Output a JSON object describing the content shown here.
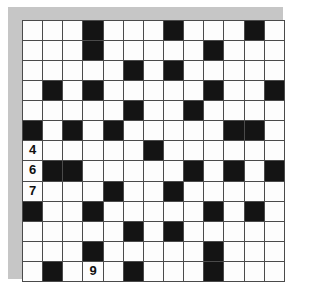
{
  "puzzle": {
    "type": "crossword-grid",
    "rows": 13,
    "columns": 13,
    "cell_size_px": 20,
    "colors": {
      "frame": "#c6c6c6",
      "grid_line": "#4a4a4a",
      "open_cell": "#fdfdfd",
      "block_cell": "#141414",
      "number_text": "#101010",
      "page_background": "#ffffff"
    },
    "legend": {
      "open_label": "open square",
      "block_label": "blocked square"
    },
    "clue_numbers": [
      {
        "number": "4",
        "row": 7,
        "column": 1
      },
      {
        "number": "6",
        "row": 8,
        "column": 1
      },
      {
        "number": "7",
        "row": 9,
        "column": 1
      },
      {
        "number": "9",
        "row": 13,
        "column": 4
      }
    ],
    "grid": [
      [
        0,
        0,
        0,
        1,
        0,
        0,
        0,
        1,
        0,
        0,
        0,
        1,
        0
      ],
      [
        0,
        0,
        0,
        1,
        0,
        0,
        0,
        0,
        0,
        1,
        0,
        0,
        0
      ],
      [
        0,
        0,
        0,
        0,
        0,
        1,
        0,
        1,
        0,
        0,
        0,
        0,
        0
      ],
      [
        0,
        1,
        0,
        1,
        0,
        0,
        0,
        0,
        0,
        1,
        0,
        0,
        1
      ],
      [
        0,
        0,
        0,
        0,
        0,
        1,
        0,
        0,
        1,
        0,
        0,
        0,
        0
      ],
      [
        1,
        0,
        1,
        0,
        1,
        0,
        0,
        0,
        0,
        0,
        1,
        1,
        0
      ],
      [
        0,
        0,
        0,
        0,
        0,
        0,
        1,
        0,
        0,
        0,
        0,
        0,
        0
      ],
      [
        0,
        1,
        1,
        0,
        0,
        0,
        0,
        0,
        1,
        0,
        1,
        0,
        1
      ],
      [
        0,
        0,
        0,
        0,
        1,
        0,
        0,
        1,
        0,
        0,
        0,
        0,
        0
      ],
      [
        1,
        0,
        0,
        1,
        0,
        0,
        0,
        0,
        0,
        1,
        0,
        1,
        0
      ],
      [
        0,
        0,
        0,
        0,
        0,
        1,
        0,
        1,
        0,
        0,
        0,
        0,
        0
      ],
      [
        0,
        0,
        0,
        1,
        0,
        0,
        0,
        0,
        0,
        1,
        0,
        0,
        0
      ],
      [
        0,
        1,
        0,
        0,
        0,
        1,
        0,
        0,
        0,
        1,
        0,
        0,
        0
      ]
    ]
  }
}
